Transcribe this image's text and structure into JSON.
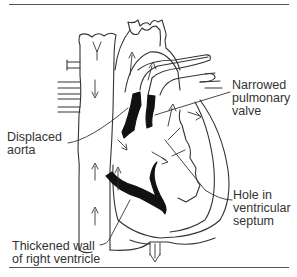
{
  "diagram": {
    "labels": {
      "narrowed_pulmonary_valve": "Narrowed\npulmonary\nvalve",
      "displaced_aorta": "Displaced\naorta",
      "hole_in_ventricular_septum": "Hole in\nventricular\nseptum",
      "thickened_wall_right_ventricle": "Thickened wall\nof right ventricle"
    },
    "colors": {
      "outline": "#333333",
      "fill_dark": "#111111",
      "background": "#ffffff"
    }
  }
}
